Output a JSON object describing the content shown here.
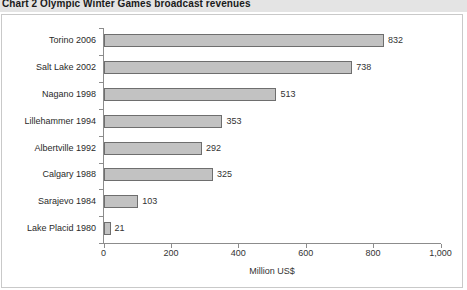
{
  "title": "Chart 2  Olympic Winter Games broadcast revenues",
  "colors": {
    "bar_fill": "#c2c2c2",
    "bar_border": "#6e6e6e",
    "axis": "#8c8c8c",
    "title_band": "#e4e4e4",
    "frame_border": "#c9c9c9",
    "text": "#333333"
  },
  "chart_data": {
    "type": "bar",
    "orientation": "horizontal",
    "title": "Chart 2  Olympic Winter Games broadcast revenues",
    "xlabel": "Million US$",
    "ylabel": "",
    "xlim": [
      0,
      1000
    ],
    "xticks": [
      0,
      200,
      400,
      600,
      800,
      1000
    ],
    "xtick_labels": [
      "0",
      "200",
      "400",
      "600",
      "800",
      "1,000"
    ],
    "grid": false,
    "legend": false,
    "categories": [
      "Torino 2006",
      "Salt Lake 2002",
      "Nagano 1998",
      "Lillehammer 1994",
      "Albertville 1992",
      "Calgary 1988",
      "Sarajevo 1984",
      "Lake Placid 1980"
    ],
    "values": [
      832,
      738,
      513,
      353,
      292,
      325,
      103,
      21
    ],
    "value_labels": [
      "832",
      "738",
      "513",
      "353",
      "292",
      "325",
      "103",
      "21"
    ]
  }
}
